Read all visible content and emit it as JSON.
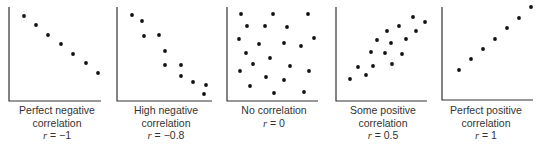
{
  "chart_data": [
    {
      "type": "scatter",
      "title": "Perfect negative correlation",
      "r_label": "r = −1",
      "r": -1,
      "axes": {
        "x0": 9,
        "x1": 101,
        "y0": 7,
        "y1": 101
      },
      "points": [
        [
          24,
          16
        ],
        [
          36,
          25
        ],
        [
          48,
          35
        ],
        [
          61,
          44
        ],
        [
          73,
          54
        ],
        [
          86,
          63
        ],
        [
          98,
          73
        ]
      ]
    },
    {
      "type": "scatter",
      "title": "High negative correlation",
      "r_label": "r = −0.8",
      "r": -0.8,
      "axes": {
        "x0": 117,
        "x1": 212,
        "y0": 7,
        "y1": 101
      },
      "points": [
        [
          132,
          15
        ],
        [
          142,
          21
        ],
        [
          144,
          36
        ],
        [
          159,
          35
        ],
        [
          165,
          51
        ],
        [
          165,
          65
        ],
        [
          181,
          65
        ],
        [
          181,
          76
        ],
        [
          193,
          82
        ],
        [
          206,
          85
        ],
        [
          204,
          94
        ]
      ]
    },
    {
      "type": "scatter",
      "title": "No correlation",
      "r_label": "r = 0",
      "r": 0,
      "axes": {
        "x0": 227,
        "x1": 318,
        "y0": 7,
        "y1": 101
      },
      "points": [
        [
          241,
          14
        ],
        [
          273,
          14
        ],
        [
          308,
          14
        ],
        [
          247,
          26
        ],
        [
          265,
          26
        ],
        [
          287,
          27
        ],
        [
          239,
          39
        ],
        [
          259,
          44
        ],
        [
          284,
          43
        ],
        [
          301,
          46
        ],
        [
          314,
          38
        ],
        [
          246,
          53
        ],
        [
          270,
          58
        ],
        [
          253,
          64
        ],
        [
          290,
          66
        ],
        [
          240,
          71
        ],
        [
          266,
          77
        ],
        [
          284,
          80
        ],
        [
          309,
          71
        ],
        [
          250,
          86
        ],
        [
          274,
          93
        ],
        [
          304,
          92
        ]
      ]
    },
    {
      "type": "scatter",
      "title": "Some positive correlation",
      "r_label": "r = 0.5",
      "r": 0.5,
      "axes": {
        "x0": 336,
        "x1": 427,
        "y0": 7,
        "y1": 101
      },
      "points": [
        [
          413,
          17
        ],
        [
          425,
          22
        ],
        [
          399,
          26
        ],
        [
          387,
          31
        ],
        [
          416,
          31
        ],
        [
          377,
          40
        ],
        [
          391,
          43
        ],
        [
          406,
          39
        ],
        [
          371,
          52
        ],
        [
          385,
          53
        ],
        [
          402,
          54
        ],
        [
          358,
          67
        ],
        [
          373,
          66
        ],
        [
          392,
          64
        ],
        [
          366,
          75
        ],
        [
          350,
          79
        ]
      ]
    },
    {
      "type": "scatter",
      "title": "Perfect positive correlation",
      "r_label": "r = 1",
      "r": 1,
      "axes": {
        "x0": 442,
        "x1": 533,
        "y0": 7,
        "y1": 100
      },
      "points": [
        [
          459,
          70
        ],
        [
          471,
          59
        ],
        [
          483,
          49
        ],
        [
          495,
          39
        ],
        [
          507,
          28
        ],
        [
          519,
          18
        ],
        [
          531,
          7
        ]
      ]
    }
  ],
  "panels": [
    {
      "line1": "Perfect negative",
      "line2": "correlation",
      "r_var": "r",
      "r_value": " = −1",
      "cx": 57
    },
    {
      "line1": "High negative",
      "line2": "correlation",
      "r_var": "r",
      "r_value": " = −0.8",
      "cx": 166
    },
    {
      "line1": "No correlation",
      "line2": "",
      "r_var": "r",
      "r_value": " = 0",
      "cx": 274
    },
    {
      "line1": "Some positive",
      "line2": "correlation",
      "r_var": "r",
      "r_value": " = 0.5",
      "cx": 383
    },
    {
      "line1": "Perfect positive",
      "line2": "correlation",
      "r_var": "r",
      "r_value": " = 1",
      "cx": 486
    }
  ],
  "colors": {
    "axis": "#333333",
    "dot": "#111111",
    "text": "#333333"
  }
}
